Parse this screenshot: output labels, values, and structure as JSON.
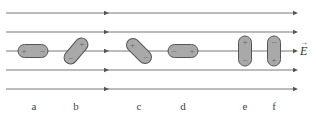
{
  "diagram": {
    "field_label": "E",
    "field_label_vector": true,
    "field_direction": "right",
    "field_lines_y": [
      13,
      32,
      51,
      70,
      89
    ],
    "colors": {
      "line": "#555555",
      "dipole_fill": "#a9a9a9",
      "dipole_stroke": "#555555",
      "label": "#444444"
    },
    "dipoles": [
      {
        "id": "a",
        "label": "a",
        "x": 33,
        "y": 51,
        "angle": 0,
        "positive_end": "left",
        "negative_end": "right"
      },
      {
        "id": "b",
        "label": "b",
        "x": 76,
        "y": 51,
        "angle": -50,
        "positive_end": "upper-right",
        "negative_end": "lower-left"
      },
      {
        "id": "c",
        "label": "c",
        "x": 139,
        "y": 51,
        "angle": 45,
        "positive_end": "upper-left",
        "negative_end": "lower-right"
      },
      {
        "id": "d",
        "label": "d",
        "x": 183,
        "y": 51,
        "angle": 0,
        "positive_end": "right",
        "negative_end": "left"
      },
      {
        "id": "e",
        "label": "e",
        "x": 245,
        "y": 51,
        "angle": 90,
        "positive_end": "top",
        "negative_end": "bottom"
      },
      {
        "id": "f",
        "label": "f",
        "x": 274,
        "y": 51,
        "angle": 90,
        "positive_end": "bottom",
        "negative_end": "top"
      }
    ],
    "labels_y": 106
  }
}
